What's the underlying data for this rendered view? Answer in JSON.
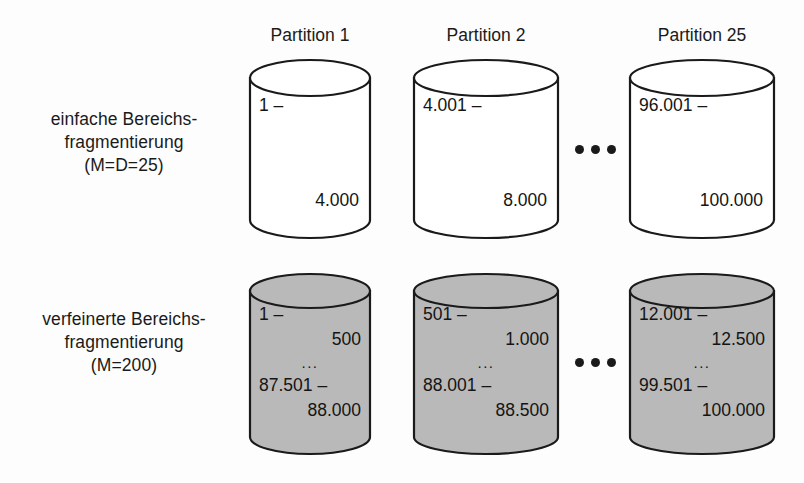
{
  "figure": {
    "background_color": "#fdfdfd",
    "line_color": "#1a1a1a",
    "shaded_fill": "#b9b9b9",
    "plain_fill": "#ffffff"
  },
  "columns": [
    {
      "header": "Partition 1"
    },
    {
      "header": "Partition 2"
    },
    {
      "header": "Partition 25"
    }
  ],
  "rows": [
    {
      "label": {
        "line1": "einfache Bereichs-",
        "line2": "fragmentierung",
        "line3": "(M=D=25)"
      },
      "style": "plain",
      "cylinders": [
        {
          "start": "1 –",
          "end": "4.000"
        },
        {
          "start": "4.001 –",
          "end": "8.000"
        },
        {
          "start": "96.001 –",
          "end": "100.000"
        }
      ],
      "separator": "•••"
    },
    {
      "label": {
        "line1": "verfeinerte Bereichs-",
        "line2": "fragmentierung",
        "line3": "(M=200)"
      },
      "style": "shaded",
      "cylinders": [
        {
          "l1": "1 –",
          "l2": "500",
          "l3": "...",
          "l4": "87.501 –",
          "l5": "88.000"
        },
        {
          "l1": "501 –",
          "l2": "1.000",
          "l3": "...",
          "l4": "88.001 –",
          "l5": "88.500"
        },
        {
          "l1": "12.001 –",
          "l2": "12.500",
          "l3": "...",
          "l4": "99.501 –",
          "l5": "100.000"
        }
      ],
      "separator": "•••"
    }
  ]
}
